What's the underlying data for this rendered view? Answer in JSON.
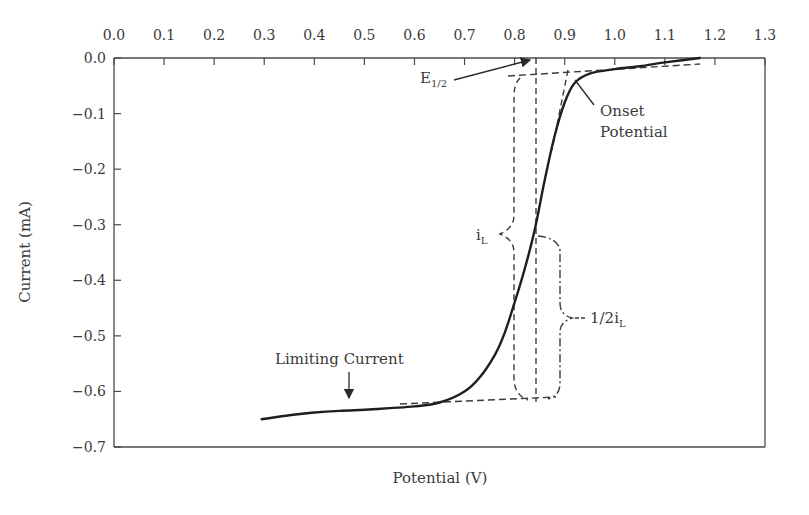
{
  "chart_data": {
    "type": "line",
    "title": "",
    "xlabel": "Potential (V)",
    "ylabel": "Current (mA)",
    "xlim": [
      0.0,
      1.3
    ],
    "ylim": [
      -0.7,
      0.0
    ],
    "x_axis_position": "top",
    "grid": false,
    "legend": null,
    "x_ticks": [
      "0.0",
      "0.1",
      "0.2",
      "0.3",
      "0.4",
      "0.5",
      "0.6",
      "0.7",
      "0.8",
      "0.9",
      "1.0",
      "1.1",
      "1.2",
      "1.3"
    ],
    "y_ticks": [
      "0.0",
      "−0.1",
      "−0.2",
      "−0.3",
      "−0.4",
      "−0.5",
      "−0.6",
      "−0.7"
    ],
    "series": [
      {
        "name": "LSV polarization curve",
        "x": [
          0.295,
          0.35,
          0.4,
          0.45,
          0.5,
          0.55,
          0.6,
          0.65,
          0.7,
          0.73,
          0.76,
          0.78,
          0.8,
          0.82,
          0.84,
          0.86,
          0.88,
          0.9,
          0.92,
          0.95,
          1.0,
          1.05,
          1.1,
          1.17
        ],
        "y": [
          -0.65,
          -0.643,
          -0.638,
          -0.635,
          -0.633,
          -0.63,
          -0.627,
          -0.62,
          -0.6,
          -0.575,
          -0.535,
          -0.495,
          -0.44,
          -0.38,
          -0.31,
          -0.22,
          -0.14,
          -0.08,
          -0.045,
          -0.028,
          -0.02,
          -0.015,
          -0.008,
          0.0
        ]
      }
    ],
    "reference_lines": {
      "e_half_potential": 0.844,
      "onset_potential": 0.908,
      "upper_baseline_current": -0.03,
      "limiting_current": -0.61
    },
    "annotations": [
      {
        "text": "E",
        "sub": "1/2",
        "points_to": [
          0.844,
          0.0
        ]
      },
      {
        "text": "Onset",
        "line2": "Potential",
        "points_to": [
          0.915,
          -0.04
        ]
      },
      {
        "text": "i",
        "sub": "L",
        "bracket": "full limiting current"
      },
      {
        "text": "1/2i",
        "sub": "L",
        "bracket": "half limiting current"
      },
      {
        "text": "Limiting Current",
        "points_to": [
          0.47,
          -0.635
        ]
      }
    ]
  },
  "labels": {
    "e_half_main": "E",
    "e_half_sub": "1/2",
    "onset_line1": "Onset",
    "onset_line2": "Potential",
    "il_main": "i",
    "il_sub": "L",
    "half_il_main": "1/2i",
    "half_il_sub": "L",
    "limiting_current": "Limiting Current",
    "xlabel": "Potential (V)",
    "ylabel": "Current (mA)"
  },
  "colors": {
    "axis": "#4a4a4a",
    "curve": "#1e1e1e",
    "dashed": "#3a3a3a",
    "text": "#3a3a3a"
  }
}
